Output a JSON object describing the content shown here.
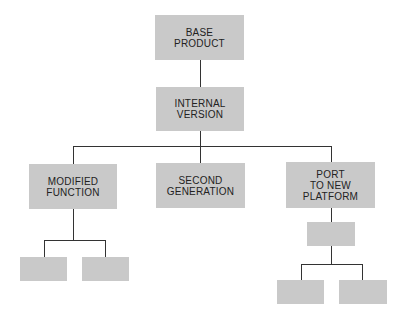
{
  "diagram": {
    "type": "tree",
    "nodes": {
      "base": {
        "label": "BASE\nPRODUCT"
      },
      "internal": {
        "label": "INTERNAL\nVERSION"
      },
      "modified": {
        "label": "MODIFIED\nFUNCTION"
      },
      "second": {
        "label": "SECOND\nGENERATION"
      },
      "port": {
        "label": "PORT\nTO NEW\nPLATFORM"
      },
      "mod_child_1": {
        "label": ""
      },
      "mod_child_2": {
        "label": ""
      },
      "port_child": {
        "label": ""
      },
      "port_grandchild_1": {
        "label": ""
      },
      "port_grandchild_2": {
        "label": ""
      }
    },
    "edges": [
      [
        "base",
        "internal"
      ],
      [
        "internal",
        "modified"
      ],
      [
        "internal",
        "second"
      ],
      [
        "internal",
        "port"
      ],
      [
        "modified",
        "mod_child_1"
      ],
      [
        "modified",
        "mod_child_2"
      ],
      [
        "port",
        "port_child"
      ],
      [
        "port_child",
        "port_grandchild_1"
      ],
      [
        "port_child",
        "port_grandchild_2"
      ]
    ],
    "colors": {
      "box_fill": "#c9c9c9",
      "line": "#333333",
      "text": "#222222"
    }
  }
}
